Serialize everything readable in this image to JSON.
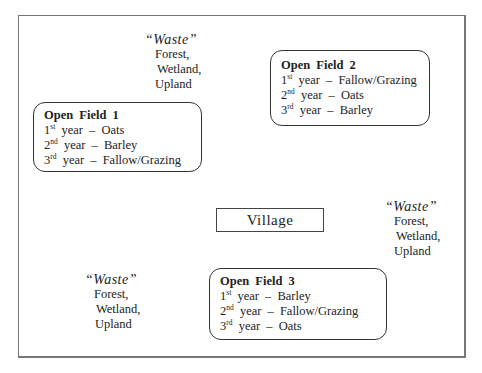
{
  "diagram": {
    "waste_areas": [
      {
        "title": "“Waste”",
        "lines": [
          "Forest,",
          "Wetland,",
          "Upland"
        ]
      },
      {
        "title": "“Waste”",
        "lines": [
          "Forest,",
          "Wetland,",
          "Upland"
        ]
      },
      {
        "title": "“Waste”",
        "lines": [
          "Forest,",
          "Wetland,",
          "Upland"
        ]
      }
    ],
    "fields": [
      {
        "title": "Open Field 1",
        "rows": [
          {
            "num": "1",
            "sup": "st",
            "text": "year – Oats"
          },
          {
            "num": "2",
            "sup": "nd",
            "text": "year – Barley"
          },
          {
            "num": "3",
            "sup": "rd",
            "text": "year – Fallow/Grazing"
          }
        ]
      },
      {
        "title": "Open Field 2",
        "rows": [
          {
            "num": "1",
            "sup": "st",
            "text": "year – Fallow/Grazing"
          },
          {
            "num": "2",
            "sup": "nd",
            "text": "year – Oats"
          },
          {
            "num": "3",
            "sup": "rd",
            "text": "year – Barley"
          }
        ]
      },
      {
        "title": "Open Field 3",
        "rows": [
          {
            "num": "1",
            "sup": "st",
            "text": "year – Barley"
          },
          {
            "num": "2",
            "sup": "nd",
            "text": "year – Fallow/Grazing"
          },
          {
            "num": "3",
            "sup": "rd",
            "text": "year – Oats"
          }
        ]
      }
    ],
    "village": {
      "label": "Village"
    }
  }
}
